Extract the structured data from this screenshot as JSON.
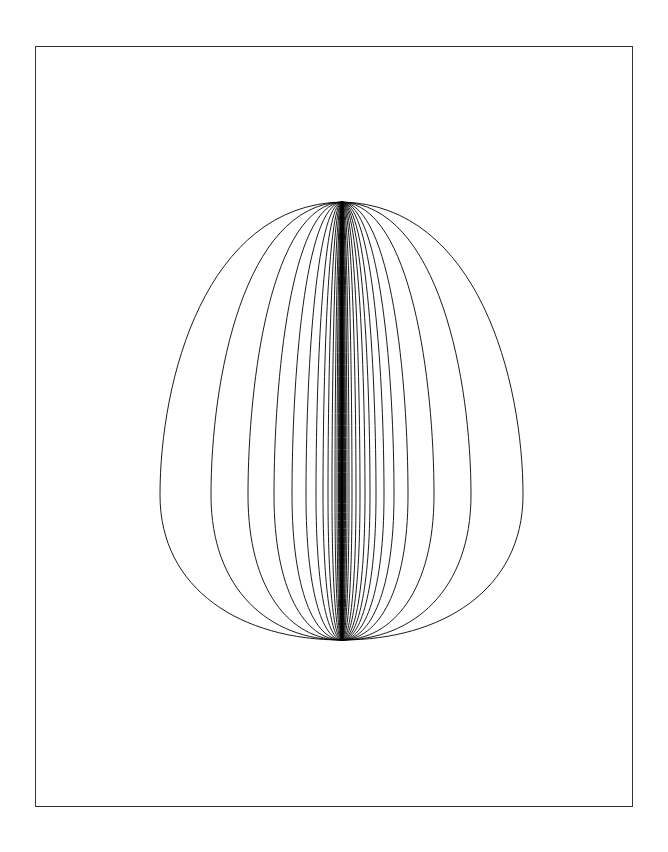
{
  "figure": {
    "frame": {
      "left": 35,
      "top": 46,
      "right": 634,
      "bottom": 808
    },
    "apex": {
      "x": 342,
      "y": 202
    },
    "base": {
      "x": 342,
      "y": 640
    },
    "widest_y": 495,
    "stroke_color": "#000000",
    "frame_color": "#333333",
    "background": "#ffffff",
    "half_widths_left": [
      182,
      131,
      94,
      68,
      50,
      36,
      26,
      19,
      14,
      10,
      7,
      5,
      3.5,
      2.5,
      1.8,
      1.2,
      0.8,
      0.4
    ],
    "half_widths_right": [
      181,
      129,
      92,
      66,
      52,
      42,
      34,
      28,
      23,
      18,
      14,
      10,
      7,
      5,
      3.5,
      2.5,
      1.6,
      0.8
    ]
  }
}
